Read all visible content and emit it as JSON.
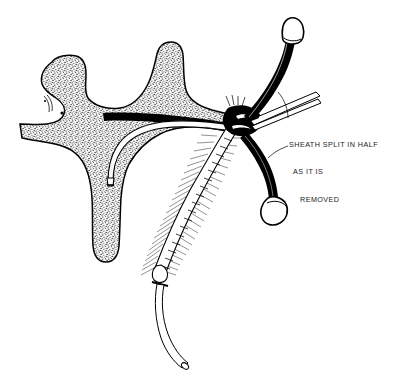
{
  "figure": {
    "kind": "medical-line-illustration",
    "background_color": "#ffffff",
    "ink_color": "#000000",
    "width": 394,
    "height": 376
  },
  "annotation": {
    "callout": {
      "name": "sheath-split-callout",
      "line1": "SHEATH SPLIT IN HALF",
      "line2": "AS IT IS",
      "line3": "REMOVED",
      "full_text": "SHEATH SPLIT IN HALF AS IT IS REMOVED",
      "color": "#1a1a1a"
    },
    "leader_lines": [
      {
        "name": "leader-to-upper-sheath-half"
      },
      {
        "name": "leader-to-lower-sheath-half"
      }
    ]
  },
  "anatomy": {
    "tissue_mass": {
      "name": "stippled-vessel-tissue",
      "description": "Branching stippled anatomical tissue / vessel wall occupying the left portion",
      "fill": "stipple",
      "outline": "#000000"
    },
    "vessel_lumen": {
      "name": "vessel-lumen-dark-band",
      "description": "Dark filled lumen band running horizontally through the tissue toward the puncture site",
      "fill": "#000000"
    },
    "branches": [
      {
        "name": "tissue-branch-upper-left"
      },
      {
        "name": "tissue-branch-left"
      },
      {
        "name": "tissue-branch-upper-middle"
      },
      {
        "name": "tissue-branch-lower"
      }
    ]
  },
  "instruments": {
    "catheter": {
      "name": "indwelling-catheter",
      "description": "White double-outlined catheter entering the vessel and curving down out of the field",
      "stroke": "#000000",
      "fill": "#ffffff"
    },
    "catheter_tip": {
      "name": "catheter-tip-in-branch",
      "description": "Distal catheter tip resting inside the lower tissue branch"
    },
    "sheath_upper_half": {
      "name": "sheath-half-upper",
      "description": "Upper peel-away sheath half pulled up and back, drawn solid black with a hub at its end"
    },
    "sheath_lower_half": {
      "name": "sheath-half-lower",
      "description": "Lower peel-away sheath half pulled down and back, drawn solid black with a hub at its end"
    },
    "hub_upper": {
      "name": "sheath-hub-upper",
      "description": "Open loop handle / hub at the top of the upper sheath half"
    },
    "hub_lower": {
      "name": "sheath-hub-lower",
      "description": "Open loop handle / hub at the bottom of the lower sheath half"
    },
    "fibrous_sheath": {
      "name": "fibrous-sheath-body",
      "description": "Hairy / fringed textured sheath body running diagonally down and left from the puncture site"
    },
    "forceps": {
      "name": "forceps-instrument",
      "description": "Thin straight instrument / forceps entering from the right toward the puncture site"
    },
    "puncture_site": {
      "name": "puncture-site-junction",
      "description": "Dense black junction where sheath, catheter and vessel meet"
    }
  }
}
